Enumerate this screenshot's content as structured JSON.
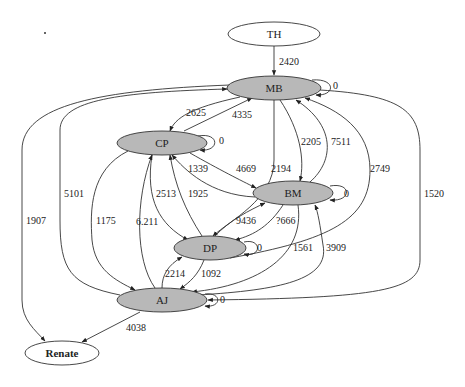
{
  "graph": {
    "nodes": {
      "TH": {
        "label": "TH",
        "style": "plain"
      },
      "MB": {
        "label": "MB",
        "style": "filled"
      },
      "CP": {
        "label": "CP",
        "style": "filled"
      },
      "BM": {
        "label": "BM",
        "style": "filled"
      },
      "DP": {
        "label": "DP",
        "style": "filled"
      },
      "AJ": {
        "label": "AJ",
        "style": "filled"
      },
      "Renate": {
        "label": "Renate",
        "style": "plain-bold"
      }
    },
    "edges": {
      "TH_MB": {
        "from": "TH",
        "to": "MB",
        "label": "2420"
      },
      "MB_MB": {
        "from": "MB",
        "to": "MB",
        "label": "0"
      },
      "MB_CP": {
        "from": "MB",
        "to": "CP",
        "label": "2625"
      },
      "CP_MB": {
        "from": "CP",
        "to": "MB",
        "label": "4335"
      },
      "CP_CP": {
        "from": "CP",
        "to": "CP",
        "label": "0"
      },
      "MB_BM": {
        "from": "MB",
        "to": "BM",
        "label": "2205"
      },
      "BM_MB": {
        "from": "BM",
        "to": "MB",
        "label": "7511"
      },
      "CP_BM": {
        "from": "CP",
        "to": "BM",
        "label": "4669"
      },
      "BM_CP": {
        "from": "BM",
        "to": "CP",
        "label": "1339"
      },
      "MB_DP": {
        "from": "MB",
        "to": "DP",
        "label": "2194"
      },
      "DP_MB": {
        "from": "DP",
        "to": "MB",
        "label": "2749"
      },
      "BM_BM": {
        "from": "BM",
        "to": "BM",
        "label": "0"
      },
      "CP_DP": {
        "from": "CP",
        "to": "DP",
        "label": "2513"
      },
      "DP_CP": {
        "from": "DP",
        "to": "CP",
        "label": "1925"
      },
      "DP_BM": {
        "from": "DP",
        "to": "BM",
        "label": "9436"
      },
      "BM_DP": {
        "from": "BM",
        "to": "DP",
        "label": "?666"
      },
      "DP_DP": {
        "from": "DP",
        "to": "DP",
        "label": "0"
      },
      "AJ_MB": {
        "from": "AJ",
        "to": "MB",
        "label": "5101"
      },
      "CP_AJ": {
        "from": "CP",
        "to": "AJ",
        "label": "1175"
      },
      "AJ_CP": {
        "from": "AJ",
        "to": "CP",
        "label": "6.211"
      },
      "AJ_DP": {
        "from": "AJ",
        "to": "DP",
        "label": "2214"
      },
      "DP_AJ": {
        "from": "DP",
        "to": "AJ",
        "label": "1092"
      },
      "BM_AJ": {
        "from": "BM",
        "to": "AJ",
        "label": "1561"
      },
      "AJ_BM": {
        "from": "AJ",
        "to": "BM",
        "label": "3909"
      },
      "MB_AJ": {
        "from": "MB",
        "to": "AJ",
        "label": "1520"
      },
      "AJ_AJ": {
        "from": "AJ",
        "to": "AJ",
        "label": "0"
      },
      "MB_Renate": {
        "from": "MB",
        "to": "Renate",
        "label": "1907"
      },
      "AJ_Renate": {
        "from": "AJ",
        "to": "Renate",
        "label": "4038"
      }
    }
  }
}
